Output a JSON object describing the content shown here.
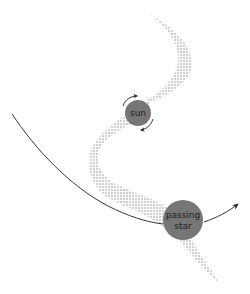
{
  "diagram": {
    "title": "",
    "labels": {
      "sun": "sun",
      "passing_star_line1": "passing",
      "passing_star_line2": "star"
    },
    "colors": {
      "background": "#ffffff",
      "body_fill": "#767676",
      "band_dots": "#8a8a8a",
      "line": "#222222",
      "label_text": "#222222"
    },
    "elements": [
      {
        "id": "sun",
        "type": "circle",
        "label": "sun",
        "annotation": "rotation arrows around sun (counter-clockwise)"
      },
      {
        "id": "passing-star",
        "type": "circle",
        "label": "passing star"
      },
      {
        "id": "trajectory",
        "type": "curved-arrow",
        "description": "path of passing star"
      },
      {
        "id": "tidal-band",
        "type": "stippled-band",
        "description": "S-shaped stream of material drawn out by tidal interaction"
      }
    ]
  }
}
